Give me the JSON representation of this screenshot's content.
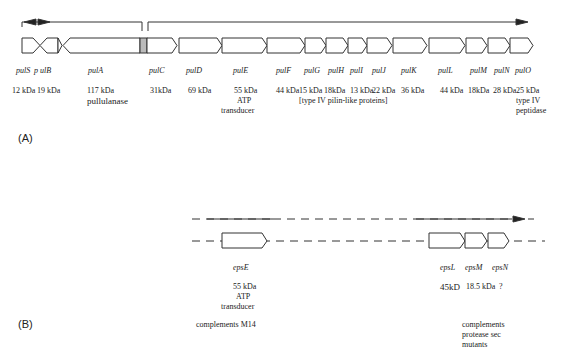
{
  "panel_a": {
    "label": "(A)",
    "genes": [
      {
        "name": "pulS",
        "size": "12 kDa"
      },
      {
        "name": "p ulB",
        "size": "19 kDa"
      },
      {
        "name": "pulA",
        "size": "117 kDa",
        "function": "pullulanase"
      },
      {
        "name": "pulC",
        "size": "31kDa"
      },
      {
        "name": "pulD",
        "size": "69 kDa"
      },
      {
        "name": "pulE",
        "size": "55 kDa",
        "function": "ATP transducer"
      },
      {
        "name": "pulF",
        "size": "44 kDa"
      },
      {
        "name": "pulG",
        "size": "15 kDa"
      },
      {
        "name": "pulH",
        "size": "18kDa"
      },
      {
        "name": "pulI",
        "size": "13 kDa"
      },
      {
        "name": "pulJ",
        "size": "22 kDa"
      },
      {
        "name": "pulK",
        "size": "36 kDa"
      },
      {
        "name": "pulL",
        "size": "44 kDa"
      },
      {
        "name": "pulM",
        "size": "18kDa"
      },
      {
        "name": "pulN",
        "size": "28 kDa"
      },
      {
        "name": "pulO",
        "size": "25 kDa",
        "function": "type IV peptidase"
      }
    ],
    "group_note": "[type IV pilin-like proteins]",
    "pulS_size_pulB_size": "12 kDa 19 kDa",
    "pulE_func_1": "ATP",
    "pulE_func_2": "transducer",
    "pulO_func_1": "type IV",
    "pulO_func_2": "peptidase"
  },
  "panel_b": {
    "label": "(B)",
    "genes": [
      {
        "name": "epsE",
        "size": "55 kDa",
        "function": "ATP transducer"
      },
      {
        "name": "epsL",
        "size": "45kD"
      },
      {
        "name": "epsM",
        "size": "18.5 kDa"
      },
      {
        "name": "epsN",
        "size": "?"
      }
    ],
    "epsE_func_1": "ATP",
    "epsE_func_2": "transducer",
    "note_left": "complements M14",
    "note_right_1": "complements",
    "note_right_2": "protease sec",
    "note_right_3": "mutants"
  }
}
